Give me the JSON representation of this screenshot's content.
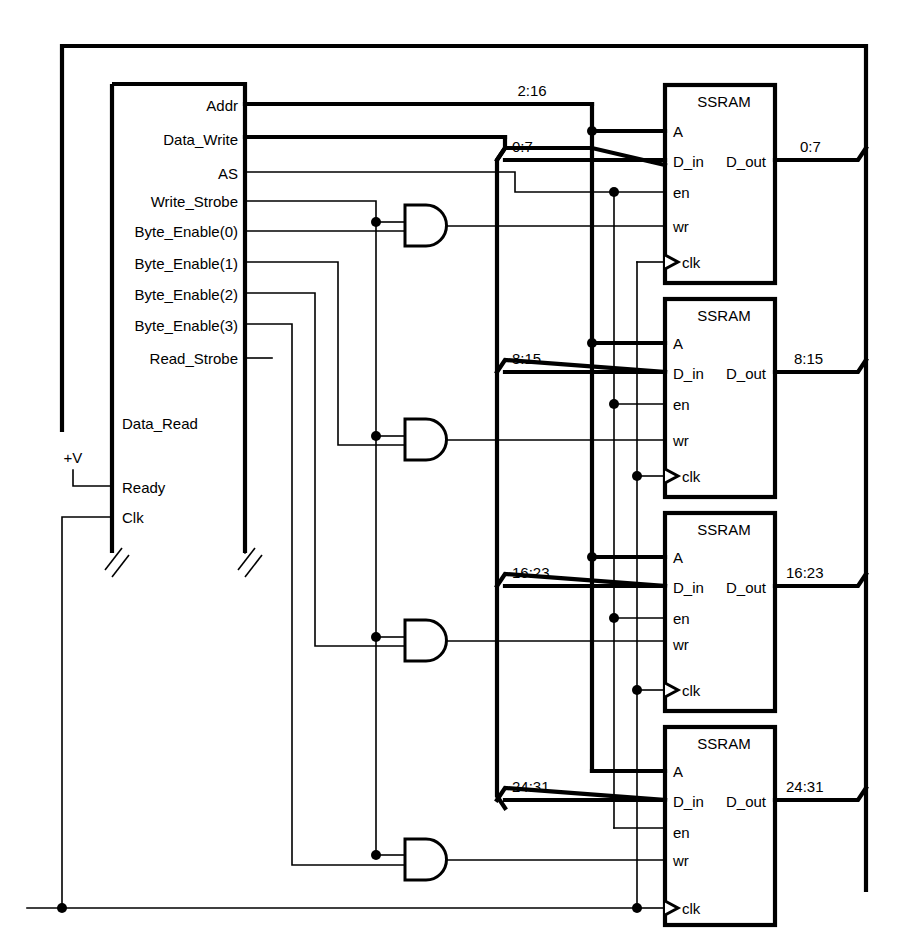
{
  "diagram": {
    "processor": {
      "name": "processor-block",
      "ports": [
        {
          "label": "Addr"
        },
        {
          "label": "Data_Write"
        },
        {
          "label": "AS"
        },
        {
          "label": "Write_Strobe"
        },
        {
          "label": "Byte_Enable(0)"
        },
        {
          "label": "Byte_Enable(1)"
        },
        {
          "label": "Byte_Enable(2)"
        },
        {
          "label": "Byte_Enable(3)"
        },
        {
          "label": "Read_Strobe"
        },
        {
          "label": "Data_Read"
        },
        {
          "label": "Ready"
        },
        {
          "label": "Clk"
        }
      ],
      "supply_label": "+V"
    },
    "memories": [
      {
        "title": "SSRAM",
        "pins": {
          "a": "A",
          "d_in": "D_in",
          "d_out": "D_out",
          "en": "en",
          "wr": "wr",
          "clk": "clk"
        },
        "addr_bus_label": "2:16",
        "data_in_label": "0:7",
        "data_out_label": "0:7"
      },
      {
        "title": "SSRAM",
        "pins": {
          "a": "A",
          "d_in": "D_in",
          "d_out": "D_out",
          "en": "en",
          "wr": "wr",
          "clk": "clk"
        },
        "addr_bus_label": "",
        "data_in_label": "8:15",
        "data_out_label": "8:15"
      },
      {
        "title": "SSRAM",
        "pins": {
          "a": "A",
          "d_in": "D_in",
          "d_out": "D_out",
          "en": "en",
          "wr": "wr",
          "clk": "clk"
        },
        "addr_bus_label": "",
        "data_in_label": "16:23",
        "data_out_label": "16:23"
      },
      {
        "title": "SSRAM",
        "pins": {
          "a": "A",
          "d_in": "D_in",
          "d_out": "D_out",
          "en": "en",
          "wr": "wr",
          "clk": "clk"
        },
        "addr_bus_label": "",
        "data_in_label": "24:31",
        "data_out_label": "24:31"
      }
    ],
    "gates": [
      {
        "type": "AND",
        "name": "and-gate-byte0"
      },
      {
        "type": "AND",
        "name": "and-gate-byte1"
      },
      {
        "type": "AND",
        "name": "and-gate-byte2"
      },
      {
        "type": "AND",
        "name": "and-gate-byte3"
      }
    ],
    "colors": {
      "line": "#000000",
      "background": "#ffffff"
    }
  }
}
